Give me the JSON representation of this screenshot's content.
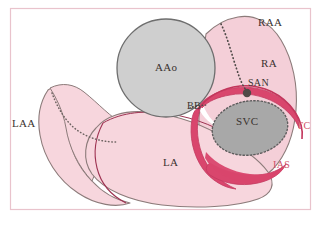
{
  "figure": {
    "frame_color": "#e9c3cc",
    "background_color": "#ffffff"
  },
  "colors": {
    "atrial_fill": "#f7d6dd",
    "atrial_stroke": "#8c7b7a",
    "vessel_fill": "#c0c0c0",
    "vessel_stroke": "#6e6e6e",
    "crest_fill": "#d9466d",
    "crest_stroke": "#c33a60",
    "septum_line": "#9e3352",
    "label_dark": "#3b3330",
    "label_red": "#cf5068",
    "node_marker": "#4f4a48",
    "dotted_path": "#5a5450"
  },
  "labels": [
    {
      "id": "laa",
      "text": "LAA",
      "x": 12,
      "y": 124,
      "color": "dark",
      "size": 11,
      "desc": "left atrial appendage"
    },
    {
      "id": "aao",
      "text": "AAo",
      "x": 157,
      "y": 63,
      "color": "dark",
      "size": 11,
      "desc": "ascending aorta"
    },
    {
      "id": "bb",
      "text": "BB",
      "x": 189,
      "y": 106,
      "color": "dark",
      "size": 10,
      "desc": "Bachmann bundle"
    },
    {
      "id": "raa",
      "text": "RAA",
      "x": 259,
      "y": 21,
      "color": "dark",
      "size": 11,
      "desc": "right atrial appendage"
    },
    {
      "id": "ra",
      "text": "RA",
      "x": 261,
      "y": 62,
      "color": "dark",
      "size": 11,
      "desc": "right atrium"
    },
    {
      "id": "san",
      "text": "SAN",
      "x": 248,
      "y": 81,
      "color": "dark",
      "size": 10,
      "desc": "sinoatrial node"
    },
    {
      "id": "svc",
      "text": "SVC",
      "x": 238,
      "y": 120,
      "color": "dark",
      "size": 11,
      "desc": "superior vena cava"
    },
    {
      "id": "tc",
      "text": "TC",
      "x": 298,
      "y": 125,
      "color": "red",
      "size": 10,
      "desc": "terminal crest"
    },
    {
      "id": "ias",
      "text": "IAS",
      "x": 274,
      "y": 164,
      "color": "red",
      "size": 10,
      "desc": "interatrial septum"
    },
    {
      "id": "la",
      "text": "LA",
      "x": 164,
      "y": 161,
      "color": "dark",
      "size": 11,
      "desc": "left atrium"
    }
  ],
  "structures": [
    {
      "id": "left-atrial-appendage",
      "kind": "atrial-tissue"
    },
    {
      "id": "left-atrium-body",
      "kind": "atrial-tissue"
    },
    {
      "id": "right-atrium",
      "kind": "atrial-tissue"
    },
    {
      "id": "ascending-aorta",
      "kind": "great-vessel"
    },
    {
      "id": "superior-vena-cava",
      "kind": "great-vessel"
    },
    {
      "id": "terminal-crest-band",
      "kind": "muscle-crest"
    },
    {
      "id": "interatrial-septum-band",
      "kind": "muscle-crest"
    },
    {
      "id": "sinoatrial-node-marker",
      "kind": "node"
    },
    {
      "id": "bachmann-bundle-path",
      "kind": "conduction-path"
    }
  ]
}
